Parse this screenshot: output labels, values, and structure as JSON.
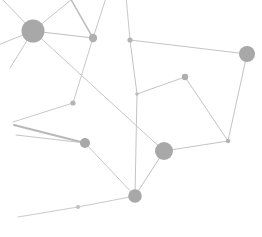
{
  "figure": {
    "kind": "network-graph",
    "width": 262,
    "height": 237,
    "background_color": "#ffffff",
    "node_color": "#a8a8a8",
    "node_color_light": "#bdbdbd",
    "edge_color": "#c4c4c4",
    "title": "",
    "subtitle": "",
    "axis_labels": [],
    "legend": [],
    "annotations": []
  },
  "chart_data": {
    "type": "scatter",
    "title": "",
    "xlabel": "",
    "ylabel": "",
    "xlim": [
      0,
      262
    ],
    "ylim": [
      0,
      237
    ],
    "grid": false,
    "legend_position": "none",
    "nodes": [
      {
        "id": "n0",
        "x": 33,
        "y": 31,
        "r": 11.5,
        "color": "#a8a8a8",
        "opacity": 1.0,
        "label": ""
      },
      {
        "id": "n1",
        "x": 93,
        "y": 38,
        "r": 4.2,
        "color": "#b0b0b0",
        "opacity": 1.0,
        "label": ""
      },
      {
        "id": "n2",
        "x": 130,
        "y": 40,
        "r": 2.6,
        "color": "#b4b4b4",
        "opacity": 1.0,
        "label": ""
      },
      {
        "id": "n3",
        "x": 247,
        "y": 54,
        "r": 8.0,
        "color": "#a8a8a8",
        "opacity": 1.0,
        "label": ""
      },
      {
        "id": "n4",
        "x": 185,
        "y": 77,
        "r": 3.2,
        "color": "#aeaeae",
        "opacity": 1.0,
        "label": ""
      },
      {
        "id": "n5",
        "x": 73,
        "y": 103,
        "r": 2.6,
        "color": "#b4b4b4",
        "opacity": 1.0,
        "label": ""
      },
      {
        "id": "n6",
        "x": 137,
        "y": 94,
        "r": 1.8,
        "color": "#bcbcbc",
        "opacity": 1.0,
        "label": ""
      },
      {
        "id": "n7",
        "x": 85,
        "y": 143,
        "r": 5.0,
        "color": "#a8a8a8",
        "opacity": 1.0,
        "label": ""
      },
      {
        "id": "n8",
        "x": 164,
        "y": 151,
        "r": 9.0,
        "color": "#a8a8a8",
        "opacity": 1.0,
        "label": ""
      },
      {
        "id": "n9",
        "x": 228,
        "y": 141,
        "r": 2.2,
        "color": "#b4b4b4",
        "opacity": 1.0,
        "label": ""
      },
      {
        "id": "n10",
        "x": 135,
        "y": 196,
        "r": 6.8,
        "color": "#a8a8a8",
        "opacity": 1.0,
        "label": ""
      },
      {
        "id": "n11",
        "x": 78,
        "y": 207,
        "r": 2.0,
        "color": "#c0c0c0",
        "opacity": 1.0,
        "label": ""
      }
    ],
    "edges": [
      {
        "source": "n0",
        "target": "n1",
        "width": 1.0,
        "color": "#c0c0c0"
      },
      {
        "source": "n0",
        "target": "n8",
        "width": 1.0,
        "color": "#c6c6c6"
      },
      {
        "source": "n0",
        "target": "stub_up_left",
        "width": 1.0,
        "color": "#c6c6c6"
      },
      {
        "source": "n0",
        "target": "stub_up",
        "width": 1.0,
        "color": "#c6c6c6"
      },
      {
        "source": "n0",
        "target": "stub_left",
        "width": 1.0,
        "color": "#c6c6c6"
      },
      {
        "source": "n0",
        "target": "stub_down_left",
        "width": 1.0,
        "color": "#c6c6c6"
      },
      {
        "source": "n1",
        "target": "stub_n1_up",
        "width": 1.6,
        "color": "#c0c0c0"
      },
      {
        "source": "n1",
        "target": "stub_n1_upright",
        "width": 1.0,
        "color": "#c6c6c6"
      },
      {
        "source": "n1",
        "target": "n5",
        "width": 1.0,
        "color": "#c8c8c8"
      },
      {
        "source": "n2",
        "target": "n3",
        "width": 1.0,
        "color": "#c4c4c4"
      },
      {
        "source": "n2",
        "target": "stub_n2_up",
        "width": 1.0,
        "color": "#c8c8c8"
      },
      {
        "source": "n2",
        "target": "n6",
        "width": 1.0,
        "color": "#c4c4c4"
      },
      {
        "source": "n3",
        "target": "n9",
        "width": 1.0,
        "color": "#c4c4c4"
      },
      {
        "source": "n4",
        "target": "n6",
        "width": 1.0,
        "color": "#c4c4c4"
      },
      {
        "source": "n4",
        "target": "n9",
        "width": 1.0,
        "color": "#c4c4c4"
      },
      {
        "source": "n5",
        "target": "stub_n5_downleft",
        "width": 1.0,
        "color": "#c8c8c8"
      },
      {
        "source": "n6",
        "target": "n10",
        "width": 1.0,
        "color": "#c4c4c4"
      },
      {
        "source": "n7",
        "target": "stub_n7_left",
        "width": 2.0,
        "color": "#b8b8b8"
      },
      {
        "source": "n7",
        "target": "stub_n7_upleft",
        "width": 1.0,
        "color": "#c6c6c6"
      },
      {
        "source": "n7",
        "target": "n10",
        "width": 1.0,
        "color": "#c8c8c8"
      },
      {
        "source": "n8",
        "target": "n9",
        "width": 1.0,
        "color": "#c4c4c4"
      },
      {
        "source": "n8",
        "target": "n10",
        "width": 1.0,
        "color": "#c0c0c0"
      },
      {
        "source": "n10",
        "target": "n11",
        "width": 1.0,
        "color": "#cacaca"
      },
      {
        "source": "n11",
        "target": "stub_n11_left",
        "width": 1.0,
        "color": "#cacaca"
      }
    ],
    "stub_points": [
      {
        "id": "stub_up_left",
        "x": 0,
        "y": -3
      },
      {
        "id": "stub_up",
        "x": 77,
        "y": -5
      },
      {
        "id": "stub_left",
        "x": -2,
        "y": 45
      },
      {
        "id": "stub_down_left",
        "x": 10,
        "y": 68
      },
      {
        "id": "stub_n1_up",
        "x": 69,
        "y": -4
      },
      {
        "id": "stub_n1_upright",
        "x": 107,
        "y": -5
      },
      {
        "id": "stub_n2_up",
        "x": 126,
        "y": -4
      },
      {
        "id": "stub_n5_downleft",
        "x": 13,
        "y": 122
      },
      {
        "id": "stub_n7_left",
        "x": 14,
        "y": 125
      },
      {
        "id": "stub_n7_upleft",
        "x": 16,
        "y": 135
      },
      {
        "id": "stub_n11_left",
        "x": 18,
        "y": 217
      }
    ],
    "counts": {
      "nodes": 12,
      "edges": 24
    }
  }
}
